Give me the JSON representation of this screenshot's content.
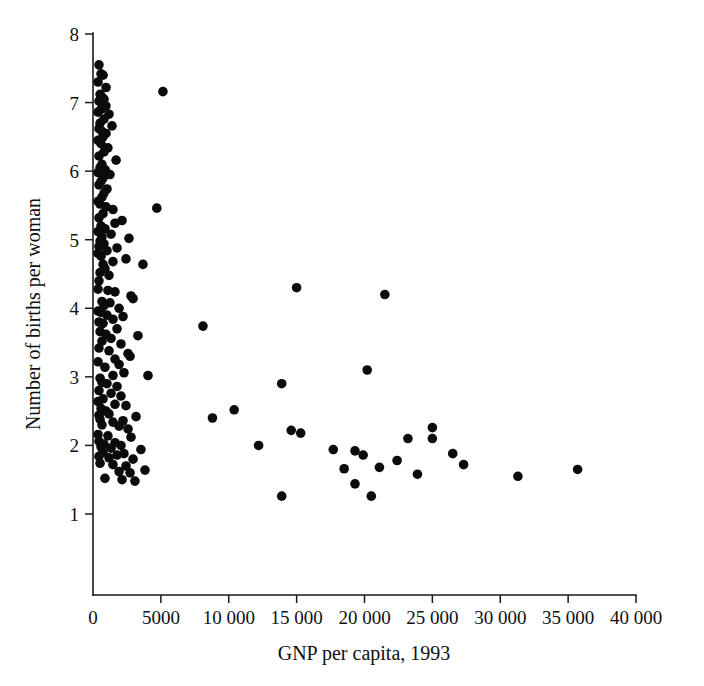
{
  "chart_data": {
    "type": "scatter",
    "title": "",
    "xlabel": "GNP per capita, 1993",
    "ylabel": "Number of births per woman",
    "xlim": [
      0,
      40000
    ],
    "ylim": [
      0,
      8
    ],
    "grid": false,
    "legend": null,
    "marker": {
      "shape": "circle",
      "color": "#0b0b0b",
      "size_px": 5.6
    },
    "xticks": [
      0,
      5000,
      10000,
      15000,
      20000,
      25000,
      30000,
      35000,
      40000
    ],
    "xticklabels": [
      "0",
      "5000",
      "10 000",
      "15 000",
      "20 000",
      "25 000",
      "30 000",
      "35 000",
      "40 000"
    ],
    "yticks": [
      1,
      2,
      3,
      4,
      5,
      6,
      7,
      8
    ],
    "yticklabels": [
      "1",
      "2",
      "3",
      "4",
      "5",
      "6",
      "7",
      "8"
    ],
    "n_points": 168,
    "points": [
      [
        440,
        7.55
      ],
      [
        590,
        7.42
      ],
      [
        740,
        7.4
      ],
      [
        370,
        7.3
      ],
      [
        960,
        7.22
      ],
      [
        5150,
        7.16
      ],
      [
        520,
        7.12
      ],
      [
        660,
        7.08
      ],
      [
        810,
        7.05
      ],
      [
        440,
        7.02
      ],
      [
        700,
        6.98
      ],
      [
        950,
        6.95
      ],
      [
        590,
        6.9
      ],
      [
        370,
        6.86
      ],
      [
        1180,
        6.83
      ],
      [
        810,
        6.76
      ],
      [
        520,
        6.7
      ],
      [
        1400,
        6.66
      ],
      [
        440,
        6.62
      ],
      [
        660,
        6.58
      ],
      [
        960,
        6.55
      ],
      [
        740,
        6.5
      ],
      [
        370,
        6.45
      ],
      [
        590,
        6.4
      ],
      [
        1100,
        6.34
      ],
      [
        810,
        6.28
      ],
      [
        440,
        6.22
      ],
      [
        1700,
        6.16
      ],
      [
        660,
        6.1
      ],
      [
        520,
        6.05
      ],
      [
        900,
        6.02
      ],
      [
        370,
        5.98
      ],
      [
        1250,
        5.95
      ],
      [
        740,
        5.9
      ],
      [
        590,
        5.85
      ],
      [
        440,
        5.8
      ],
      [
        1030,
        5.74
      ],
      [
        810,
        5.68
      ],
      [
        660,
        5.62
      ],
      [
        370,
        5.56
      ],
      [
        520,
        5.52
      ],
      [
        960,
        5.48
      ],
      [
        1470,
        5.44
      ],
      [
        4700,
        5.46
      ],
      [
        740,
        5.38
      ],
      [
        440,
        5.32
      ],
      [
        2140,
        5.28
      ],
      [
        1620,
        5.24
      ],
      [
        590,
        5.2
      ],
      [
        880,
        5.16
      ],
      [
        370,
        5.12
      ],
      [
        1330,
        5.08
      ],
      [
        660,
        5.04
      ],
      [
        2650,
        5.02
      ],
      [
        520,
        4.98
      ],
      [
        810,
        4.94
      ],
      [
        440,
        4.9
      ],
      [
        1770,
        4.88
      ],
      [
        1030,
        4.84
      ],
      [
        370,
        4.8
      ],
      [
        590,
        4.76
      ],
      [
        2430,
        4.72
      ],
      [
        1470,
        4.68
      ],
      [
        740,
        4.64
      ],
      [
        3680,
        4.64
      ],
      [
        880,
        4.58
      ],
      [
        520,
        4.52
      ],
      [
        1180,
        4.48
      ],
      [
        440,
        4.4
      ],
      [
        370,
        4.28
      ],
      [
        1100,
        4.26
      ],
      [
        1620,
        4.24
      ],
      [
        2800,
        4.18
      ],
      [
        2950,
        4.14
      ],
      [
        15000,
        4.3
      ],
      [
        21500,
        4.2
      ],
      [
        660,
        4.1
      ],
      [
        1250,
        4.08
      ],
      [
        810,
        4.04
      ],
      [
        1920,
        4.0
      ],
      [
        370,
        3.96
      ],
      [
        590,
        3.94
      ],
      [
        1030,
        3.9
      ],
      [
        2210,
        3.88
      ],
      [
        1470,
        3.84
      ],
      [
        440,
        3.8
      ],
      [
        740,
        3.78
      ],
      [
        8100,
        3.74
      ],
      [
        1770,
        3.7
      ],
      [
        520,
        3.66
      ],
      [
        960,
        3.62
      ],
      [
        3310,
        3.6
      ],
      [
        1330,
        3.56
      ],
      [
        660,
        3.52
      ],
      [
        2060,
        3.48
      ],
      [
        440,
        3.42
      ],
      [
        1180,
        3.38
      ],
      [
        2580,
        3.34
      ],
      [
        2730,
        3.3
      ],
      [
        1620,
        3.26
      ],
      [
        370,
        3.22
      ],
      [
        1920,
        3.18
      ],
      [
        880,
        3.14
      ],
      [
        20200,
        3.1
      ],
      [
        2280,
        3.06
      ],
      [
        1470,
        3.02
      ],
      [
        520,
        2.98
      ],
      [
        4050,
        3.02
      ],
      [
        660,
        2.92
      ],
      [
        1030,
        2.9
      ],
      [
        1770,
        2.86
      ],
      [
        13900,
        2.9
      ],
      [
        440,
        2.8
      ],
      [
        1330,
        2.76
      ],
      [
        2060,
        2.72
      ],
      [
        740,
        2.68
      ],
      [
        370,
        2.64
      ],
      [
        1620,
        2.6
      ],
      [
        2430,
        2.58
      ],
      [
        10400,
        2.52
      ],
      [
        590,
        2.54
      ],
      [
        960,
        2.5
      ],
      [
        1180,
        2.46
      ],
      [
        440,
        2.44
      ],
      [
        3170,
        2.42
      ],
      [
        8800,
        2.4
      ],
      [
        520,
        2.38
      ],
      [
        2210,
        2.36
      ],
      [
        1470,
        2.34
      ],
      [
        25000,
        2.26
      ],
      [
        660,
        2.3
      ],
      [
        1920,
        2.28
      ],
      [
        2580,
        2.24
      ],
      [
        14600,
        2.22
      ],
      [
        15300,
        2.18
      ],
      [
        370,
        2.16
      ],
      [
        1100,
        2.14
      ],
      [
        25000,
        2.1
      ],
      [
        2800,
        2.12
      ],
      [
        23200,
        2.1
      ],
      [
        440,
        2.06
      ],
      [
        1620,
        2.04
      ],
      [
        810,
        2.02
      ],
      [
        2060,
        2.0
      ],
      [
        12200,
        2.0
      ],
      [
        590,
        1.98
      ],
      [
        1330,
        1.96
      ],
      [
        3530,
        1.94
      ],
      [
        17700,
        1.94
      ],
      [
        19300,
        1.92
      ],
      [
        26500,
        1.88
      ],
      [
        740,
        1.9
      ],
      [
        2280,
        1.88
      ],
      [
        1770,
        1.86
      ],
      [
        19900,
        1.86
      ],
      [
        440,
        1.84
      ],
      [
        1180,
        1.82
      ],
      [
        2950,
        1.8
      ],
      [
        22400,
        1.78
      ],
      [
        27300,
        1.72
      ],
      [
        520,
        1.74
      ],
      [
        1470,
        1.72
      ],
      [
        2430,
        1.7
      ],
      [
        21100,
        1.68
      ],
      [
        18500,
        1.66
      ],
      [
        3830,
        1.64
      ],
      [
        1920,
        1.62
      ],
      [
        2730,
        1.6
      ],
      [
        23900,
        1.58
      ],
      [
        35700,
        1.65
      ],
      [
        31300,
        1.55
      ],
      [
        880,
        1.52
      ],
      [
        2140,
        1.5
      ],
      [
        3090,
        1.48
      ],
      [
        19300,
        1.44
      ],
      [
        13900,
        1.26
      ],
      [
        20500,
        1.26
      ]
    ]
  },
  "axes": {
    "x_title": "GNP per capita, 1993",
    "y_title": "Number of births per woman"
  }
}
